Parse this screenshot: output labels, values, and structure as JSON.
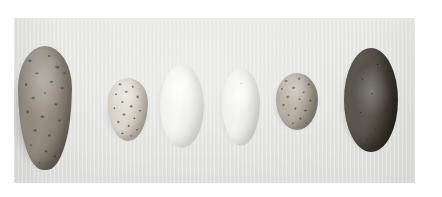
{
  "plate": {
    "kind": "photographic-plate",
    "caption": "",
    "background_color": "#ffffff",
    "photo_background_color": "#e4e4e2",
    "photo_rect": {
      "x": 14,
      "y": 18,
      "width": 401,
      "height": 165
    },
    "canvas": {
      "width": 442,
      "height": 197
    },
    "subject": "six bird eggs arranged in a row on a plain light-grey studio background",
    "arrangement": "single horizontal row, left to right, varying size and pattern",
    "lighting": "soft diffuse light from upper-left; each egg casts a faint shadow to its lower-left"
  },
  "specimens": [
    {
      "index": 1,
      "name": "egg-1",
      "shape": "pyriform",
      "shape_label": "large pear-shaped / conical",
      "size_label": "largest",
      "ground_color": "#8c8478",
      "ground_color_label": "olive grey-brown",
      "marking_color": "#262220",
      "marking_label": "heavy dark brown-black speckles and blotches, densest over the broad end",
      "pattern": "speckled",
      "rect": {
        "x": 18,
        "y": 46,
        "width": 54,
        "height": 124
      }
    },
    {
      "index": 2,
      "name": "egg-2",
      "shape": "ovate",
      "shape_label": "small oval",
      "size_label": "small",
      "ground_color": "#d3ccbe",
      "ground_color_label": "pale cream",
      "marking_color": "#1a1713",
      "marking_label": "bold black blotches and fine specks scattered over the whole shell",
      "pattern": "blotched",
      "rect": {
        "x": 108,
        "y": 78,
        "width": 40,
        "height": 63
      }
    },
    {
      "index": 3,
      "name": "egg-3",
      "shape": "elliptical",
      "shape_label": "elongated oval",
      "size_label": "medium",
      "ground_color": "#f0f0ec",
      "ground_color_label": "plain white",
      "marking_color": "",
      "marking_label": "unmarked",
      "pattern": "plain",
      "rect": {
        "x": 160,
        "y": 64,
        "width": 44,
        "height": 84
      }
    },
    {
      "index": 4,
      "name": "egg-4",
      "shape": "elliptical",
      "shape_label": "narrow oval",
      "size_label": "medium-small",
      "ground_color": "#ededE7",
      "ground_color_label": "plain off-white cream",
      "marking_color": "",
      "marking_label": "unmarked apart from a single faint dot",
      "pattern": "plain",
      "rect": {
        "x": 222,
        "y": 68,
        "width": 38,
        "height": 78
      }
    },
    {
      "index": 5,
      "name": "egg-5",
      "shape": "subspherical",
      "shape_label": "small rounded oval",
      "size_label": "smallest",
      "ground_color": "#a79e8f",
      "ground_color_label": "grey-buff",
      "marking_color": "#2a251f",
      "marking_label": "dense overall mottling of dark grey-brown, almost obscuring the ground",
      "pattern": "mottled",
      "rect": {
        "x": 276,
        "y": 73,
        "width": 42,
        "height": 57
      }
    },
    {
      "index": 6,
      "name": "egg-6",
      "shape": "oval",
      "shape_label": "large broad oval",
      "size_label": "large",
      "ground_color": "#4a443c",
      "ground_color_label": "uniform dark olive-brown",
      "marking_color": "#14120f",
      "marking_label": "a few tiny darker pinpoint spots",
      "pattern": "plain-dark",
      "rect": {
        "x": 344,
        "y": 48,
        "width": 54,
        "height": 104
      }
    }
  ]
}
